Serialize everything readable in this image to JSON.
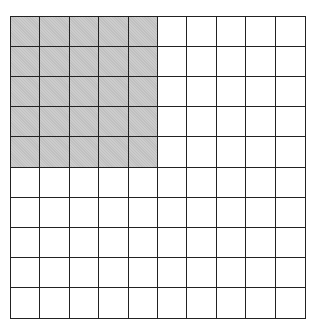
{
  "diagram": {
    "type": "hundred-grid",
    "rows": 10,
    "cols": 10,
    "shaded": {
      "rows": 5,
      "cols": 5,
      "origin": "top-left"
    },
    "shaded_count": 25,
    "total_count": 100,
    "colors": {
      "shaded": "#c8c8c8",
      "unshaded": "#ffffff",
      "line": "#222222"
    }
  }
}
